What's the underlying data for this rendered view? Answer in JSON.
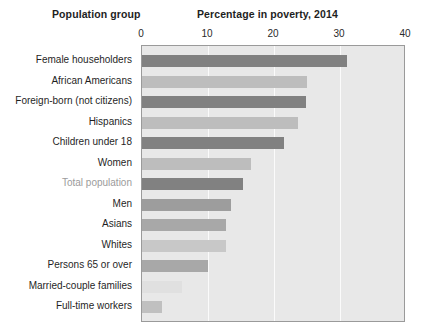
{
  "headers": {
    "population_group": "Population group",
    "percentage": "Percentage in poverty, 2014"
  },
  "colors": {
    "plot_background": "#e8e8e8",
    "plot_border": "#9a9a9a",
    "gridline": "#fbfbfb",
    "axis_text": "#2a2a2a",
    "label_text": "#1f1f1f",
    "highlight_label_text": "#9b9b9b",
    "bar_dark": "#818181",
    "bar_mid": "#9d9d9d",
    "bar_light": "#bdbdbd",
    "bar_pale": "#d2d2d2",
    "bar_faint": "#e0e0e0"
  },
  "chart_data": {
    "type": "bar",
    "orientation": "horizontal",
    "title": "Percentage in poverty, 2014",
    "xlabel": "Percentage in poverty, 2014",
    "ylabel": "Population group",
    "xlim": [
      0,
      40
    ],
    "xticks": [
      0,
      10,
      20,
      30,
      40
    ],
    "ticklabels": [
      "0",
      "10",
      "20",
      "30",
      "40"
    ],
    "grid": true,
    "gridlines_at": [
      10,
      20,
      30
    ],
    "legend": false,
    "categories": [
      "Female householders",
      "African Americans",
      "Foreign-born (not citizens)",
      "Hispanics",
      "Children under 18",
      "Women",
      "Total population",
      "Men",
      "Asians",
      "Whites",
      "Persons 65 or over",
      "Married-couple families",
      "Full-time workers"
    ],
    "values": [
      31.0,
      25.0,
      24.8,
      23.6,
      21.5,
      16.5,
      15.3,
      13.5,
      12.8,
      12.7,
      10.0,
      6.0,
      3.0
    ],
    "highlighted_category": "Total population",
    "bar_colors": [
      "#818181",
      "#bdbdbd",
      "#818181",
      "#bdbdbd",
      "#818181",
      "#bdbdbd",
      "#818181",
      "#9d9d9d",
      "#a8a8a8",
      "#c8c8c8",
      "#a8a8a8",
      "#e0e0e0",
      "#c0c0c0"
    ]
  }
}
